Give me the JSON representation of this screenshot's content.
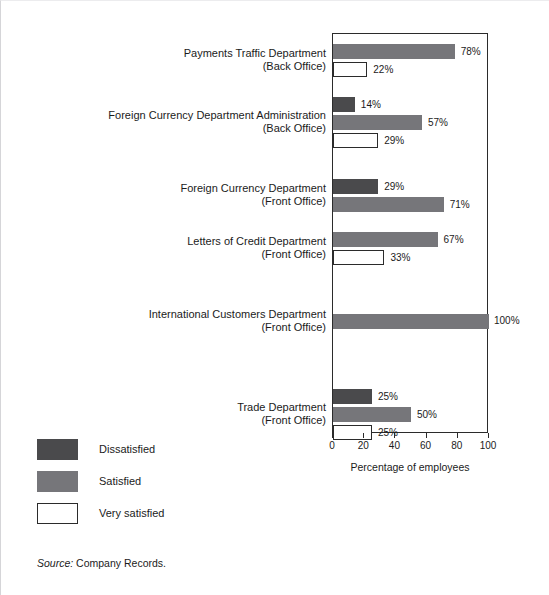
{
  "chart_data": {
    "type": "bar",
    "orientation": "horizontal",
    "title": "",
    "xlabel": "Percentage of employees",
    "ylabel": "",
    "xlim": [
      0,
      100
    ],
    "xticks": [
      0,
      20,
      40,
      60,
      80,
      100
    ],
    "grid": false,
    "legend_position": "below-left",
    "value_suffix": "%",
    "series": [
      {
        "name": "Dissatisfied",
        "color": "#4a4a4c"
      },
      {
        "name": "Satisfied",
        "color": "#76767a"
      },
      {
        "name": "Very satisfied",
        "color": "#ffffff"
      }
    ],
    "categories": [
      {
        "line1": "Payments Traffic Department",
        "line2": "(Back Office)",
        "bars": [
          {
            "series": "Satisfied",
            "value": 78,
            "label": "78%"
          },
          {
            "series": "Very satisfied",
            "value": 22,
            "label": "22%"
          }
        ]
      },
      {
        "line1": "Foreign Currency Department Administration",
        "line2": "(Back Office)",
        "bars": [
          {
            "series": "Dissatisfied",
            "value": 14,
            "label": "14%"
          },
          {
            "series": "Satisfied",
            "value": 57,
            "label": "57%"
          },
          {
            "series": "Very satisfied",
            "value": 29,
            "label": "29%"
          }
        ]
      },
      {
        "line1": "Foreign Currency Department",
        "line2": "(Front Office)",
        "bars": [
          {
            "series": "Dissatisfied",
            "value": 29,
            "label": "29%"
          },
          {
            "series": "Satisfied",
            "value": 71,
            "label": "71%"
          }
        ]
      },
      {
        "line1": "Letters of Credit Department",
        "line2": "(Front Office)",
        "bars": [
          {
            "series": "Satisfied",
            "value": 67,
            "label": "67%"
          },
          {
            "series": "Very satisfied",
            "value": 33,
            "label": "33%"
          }
        ]
      },
      {
        "line1": "International Customers Department",
        "line2": "(Front Office)",
        "bars": [
          {
            "series": "Satisfied",
            "value": 100,
            "label": "100%"
          }
        ]
      },
      {
        "line1": "Trade Department",
        "line2": "(Front Office)",
        "bars": [
          {
            "series": "Dissatisfied",
            "value": 25,
            "label": "25%"
          },
          {
            "series": "Satisfied",
            "value": 50,
            "label": "50%"
          },
          {
            "series": "Very satisfied",
            "value": 25,
            "label": "25%"
          }
        ]
      }
    ]
  },
  "legend": {
    "items": [
      {
        "label": "Dissatisfied",
        "key": "dissatisfied"
      },
      {
        "label": "Satisfied",
        "key": "satisfied"
      },
      {
        "label": "Very satisfied",
        "key": "very"
      }
    ]
  },
  "source": {
    "keyword": "Source:",
    "text": "Company Records."
  }
}
